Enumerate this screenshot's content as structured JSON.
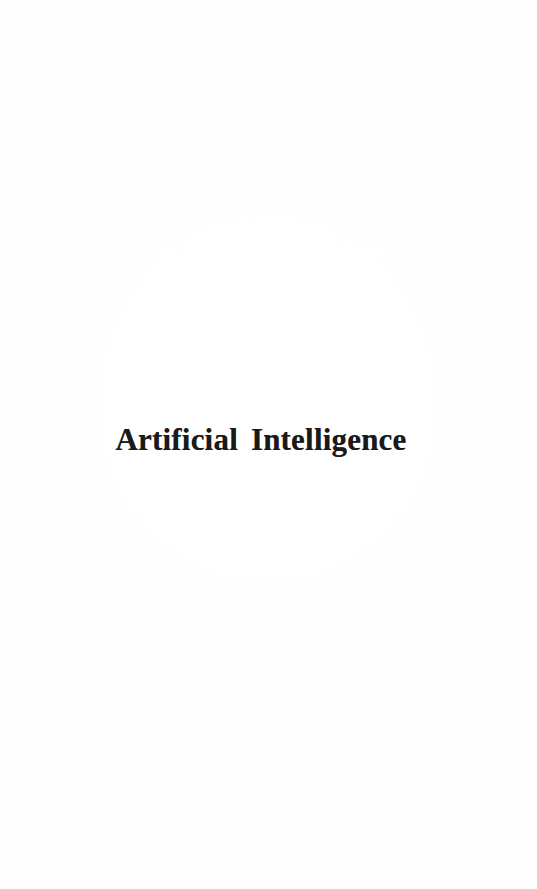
{
  "document": {
    "kind": "scanned-book-page",
    "page_type": "section-divider",
    "background_color": "#ffffff",
    "ink_color": "#1a1a1a",
    "width": 537,
    "height": 889
  },
  "page": {
    "title": "Artificial Intelligence",
    "body_text": "",
    "header": "",
    "footer": "",
    "page_number": ""
  }
}
